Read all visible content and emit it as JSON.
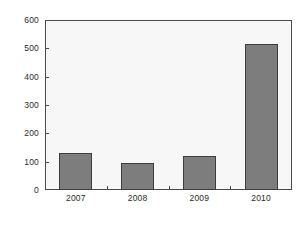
{
  "chart_data": {
    "type": "bar",
    "title": "",
    "subtitle": "",
    "xlabel": "",
    "ylabel": "",
    "categories": [
      "2007",
      "2008",
      "2009",
      "2010"
    ],
    "values": [
      130,
      95,
      120,
      515
    ],
    "series": [
      {
        "name": "",
        "values": [
          130,
          95,
          120,
          515
        ]
      }
    ],
    "ylim": [
      0,
      600
    ],
    "yticks": [
      0,
      100,
      200,
      300,
      400,
      500,
      600
    ],
    "ytick_labels": [
      "0",
      "100",
      "200",
      "300",
      "400",
      "500",
      "600"
    ],
    "grid": false,
    "legend": null,
    "legend_position": "none",
    "annotations": [],
    "colors": {
      "bar_fill": "#7d7d7d",
      "bar_border": "#3d3d3d",
      "plot_background": "#f7f7f7",
      "frame": "#4a4a4a",
      "text": "#2b2b2b",
      "page_background": "#ffffff"
    }
  }
}
